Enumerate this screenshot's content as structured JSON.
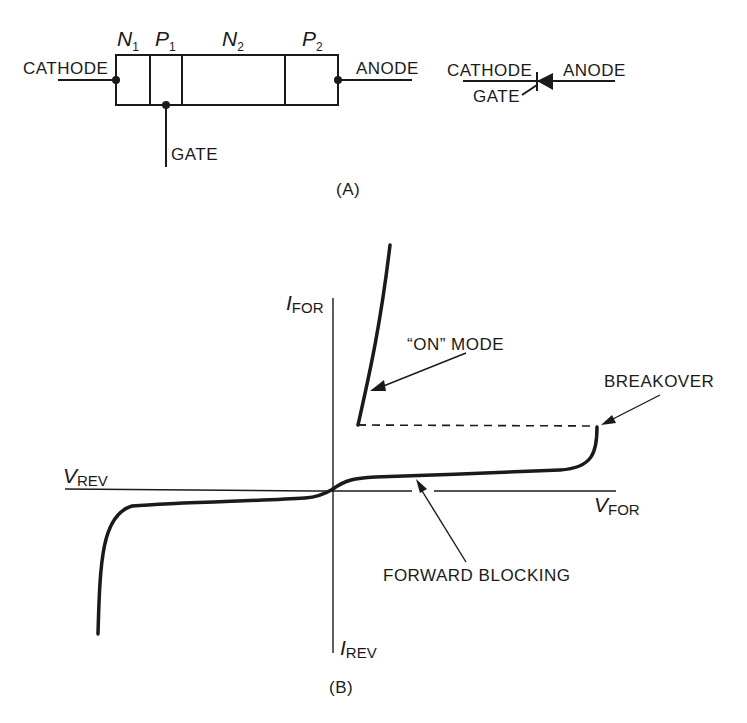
{
  "figure_a": {
    "caption": "(A)",
    "regions": [
      {
        "letter": "N",
        "sub": "1"
      },
      {
        "letter": "P",
        "sub": "1"
      },
      {
        "letter": "N",
        "sub": "2"
      },
      {
        "letter": "P",
        "sub": "2"
      }
    ],
    "terminals": {
      "cathode": "CATHODE",
      "anode": "ANODE",
      "gate": "GATE"
    },
    "symbol": {
      "cathode": "CATHODE",
      "anode": "ANODE",
      "gate": "GATE"
    }
  },
  "figure_b": {
    "caption": "(B)",
    "axes": {
      "i_for": {
        "letter": "I",
        "sub": "FOR"
      },
      "i_rev": {
        "letter": "I",
        "sub": "REV"
      },
      "v_rev": {
        "letter": "V",
        "sub": "REV"
      },
      "v_for": {
        "letter": "V",
        "sub": "FOR"
      }
    },
    "annotations": {
      "on_mode": "“ON” MODE",
      "breakover": "BREAKOVER",
      "forward_blocking": "FORWARD BLOCKING"
    }
  },
  "colors": {
    "ink": "#1a1a1a",
    "background": "#ffffff"
  }
}
